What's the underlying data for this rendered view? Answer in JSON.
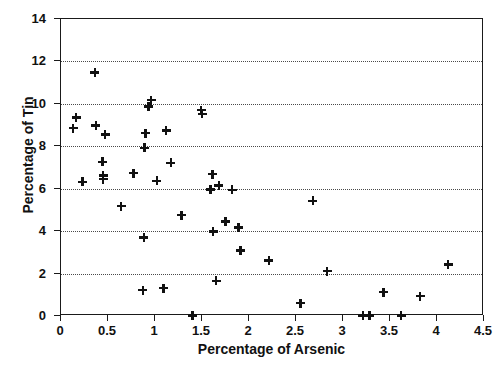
{
  "chart_data": {
    "type": "scatter",
    "title": "",
    "xlabel": "Percentage of Arsenic",
    "ylabel": "Percentage of Tin",
    "xlim": [
      0,
      4.5
    ],
    "ylim": [
      0,
      14
    ],
    "xticks": [
      0,
      0.5,
      1,
      1.5,
      2,
      2.5,
      3,
      3.5,
      4,
      4.5
    ],
    "xticklabels": [
      "0",
      "0.5",
      "1",
      "1.5",
      "2",
      "2.5",
      "3",
      "3.5",
      "4",
      "4.5"
    ],
    "yticks": [
      0,
      2,
      4,
      6,
      8,
      10,
      12,
      14
    ],
    "yticklabels": [
      "0",
      "2",
      "4",
      "6",
      "8",
      "10",
      "12",
      "14"
    ],
    "grid": "horizontal-dotted",
    "gridlines_y": [
      2,
      4,
      6,
      8,
      10,
      12
    ],
    "legend": null,
    "marker": "plus",
    "marker_color": "#111111",
    "frame_color": "#1a1a1a",
    "points": [
      {
        "x": 0.13,
        "y": 8.85
      },
      {
        "x": 0.16,
        "y": 9.35
      },
      {
        "x": 0.23,
        "y": 6.33
      },
      {
        "x": 0.36,
        "y": 11.48
      },
      {
        "x": 0.37,
        "y": 8.98
      },
      {
        "x": 0.44,
        "y": 7.27
      },
      {
        "x": 0.45,
        "y": 6.62
      },
      {
        "x": 0.45,
        "y": 6.45
      },
      {
        "x": 0.47,
        "y": 8.55
      },
      {
        "x": 0.64,
        "y": 5.18
      },
      {
        "x": 0.77,
        "y": 6.73
      },
      {
        "x": 0.87,
        "y": 1.22
      },
      {
        "x": 0.88,
        "y": 3.7
      },
      {
        "x": 0.89,
        "y": 7.93
      },
      {
        "x": 0.9,
        "y": 8.62
      },
      {
        "x": 0.93,
        "y": 9.88
      },
      {
        "x": 0.96,
        "y": 10.18
      },
      {
        "x": 1.02,
        "y": 6.37
      },
      {
        "x": 1.09,
        "y": 1.31
      },
      {
        "x": 1.12,
        "y": 8.75
      },
      {
        "x": 1.17,
        "y": 7.22
      },
      {
        "x": 1.28,
        "y": 4.76
      },
      {
        "x": 1.4,
        "y": 0.03
      },
      {
        "x": 1.49,
        "y": 9.7
      },
      {
        "x": 1.5,
        "y": 9.53
      },
      {
        "x": 1.59,
        "y": 5.97
      },
      {
        "x": 1.61,
        "y": 6.68
      },
      {
        "x": 1.62,
        "y": 3.99
      },
      {
        "x": 1.65,
        "y": 1.65
      },
      {
        "x": 1.68,
        "y": 6.15
      },
      {
        "x": 1.75,
        "y": 4.46
      },
      {
        "x": 1.82,
        "y": 5.95
      },
      {
        "x": 1.89,
        "y": 4.18
      },
      {
        "x": 1.91,
        "y": 3.08
      },
      {
        "x": 2.21,
        "y": 2.61
      },
      {
        "x": 2.55,
        "y": 0.6
      },
      {
        "x": 2.68,
        "y": 5.43
      },
      {
        "x": 2.83,
        "y": 2.12
      },
      {
        "x": 3.21,
        "y": 0.02
      },
      {
        "x": 3.28,
        "y": 0.02
      },
      {
        "x": 3.43,
        "y": 1.13
      },
      {
        "x": 3.62,
        "y": 0.02
      },
      {
        "x": 3.82,
        "y": 0.93
      },
      {
        "x": 4.12,
        "y": 2.43
      }
    ]
  }
}
